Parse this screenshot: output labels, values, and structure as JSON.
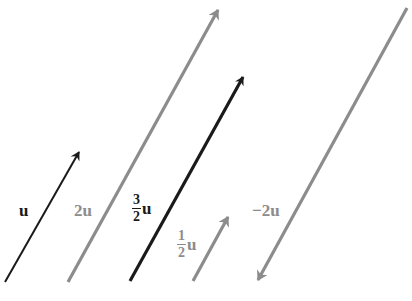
{
  "colors": {
    "black": "#1a1a1a",
    "gray": "#8c8c8c",
    "background": "#ffffff"
  },
  "vectors": [
    {
      "id": "u",
      "label": "u",
      "scalar": "1",
      "color": "black",
      "x1": 5,
      "y1": 282,
      "x2": 79,
      "y2": 152
    },
    {
      "id": "2u",
      "label": "2u",
      "scalar": "2",
      "color": "gray",
      "x1": 68,
      "y1": 282,
      "x2": 218,
      "y2": 10
    },
    {
      "id": "three-halves-u",
      "label_num": "3",
      "label_den": "2",
      "label_var": "u",
      "scalar": "3/2",
      "color": "black",
      "x1": 130,
      "y1": 281,
      "x2": 243,
      "y2": 77
    },
    {
      "id": "half-u",
      "label_num": "1",
      "label_den": "2",
      "label_var": "u",
      "scalar": "1/2",
      "color": "gray",
      "x1": 193,
      "y1": 281,
      "x2": 228,
      "y2": 217
    },
    {
      "id": "neg-2u",
      "label": "−2u",
      "scalar": "-2",
      "color": "gray",
      "x1": 407,
      "y1": 8,
      "x2": 258,
      "y2": 280
    }
  ],
  "labels": {
    "u": "u",
    "two_u": "2u",
    "three_halves": {
      "num": "3",
      "den": "2",
      "var": "u"
    },
    "one_half": {
      "num": "1",
      "den": "2",
      "var": "u"
    },
    "neg_two_u": "−2u"
  }
}
